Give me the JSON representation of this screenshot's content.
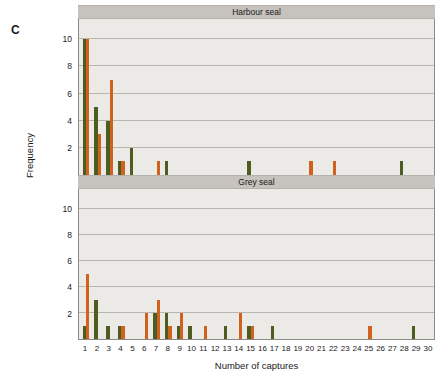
{
  "figure": {
    "panel_letter": "C",
    "x_axis_title": "Number of captures",
    "y_axis_title": "Frequency"
  },
  "panels": [
    {
      "key": "harbour",
      "title": "Harbour seal"
    },
    {
      "key": "grey",
      "title": "Grey seal"
    }
  ],
  "axis": {
    "y_ticks": [
      2,
      4,
      6,
      8,
      10
    ],
    "y_min": 0,
    "y_max": 11.5,
    "x_ticks": [
      1,
      2,
      3,
      4,
      5,
      6,
      7,
      8,
      9,
      10,
      11,
      12,
      13,
      14,
      15,
      16,
      17,
      18,
      19,
      20,
      21,
      22,
      23,
      24,
      25,
      26,
      27,
      28,
      29,
      30
    ],
    "x_min": 0.4,
    "x_max": 30.6
  },
  "colors": {
    "green": "#4d5c1f",
    "orange": "#d1611f",
    "plot_background": "#eceae7",
    "strip_background": "#c6c2bd",
    "gridline": "#b9b5b1",
    "axis_line": "#8e8a86",
    "text": "#1a1a1a"
  },
  "chart_data": {
    "type": "bar",
    "title": "",
    "xlabel": "Number of captures",
    "ylabel": "Frequency",
    "ylim": [
      0,
      11.5
    ],
    "xlim": [
      0.4,
      30.6
    ],
    "grid": true,
    "legend": "none",
    "panels": [
      {
        "name": "Harbour seal",
        "categories": [
          1,
          2,
          3,
          4,
          5,
          6,
          7,
          8,
          9,
          10,
          11,
          12,
          13,
          14,
          15,
          16,
          17,
          18,
          19,
          20,
          21,
          22,
          23,
          24,
          25,
          26,
          27,
          28,
          29,
          30
        ],
        "series": [
          {
            "name": "green",
            "color": "#4d5c1f",
            "values": [
              10,
              5,
              4,
              1,
              2,
              0,
              0,
              1,
              0,
              0,
              0,
              0,
              0,
              0,
              1,
              0,
              0,
              0,
              0,
              0,
              0,
              0,
              0,
              0,
              0,
              0,
              0,
              1,
              0,
              0
            ]
          },
          {
            "name": "orange",
            "color": "#d1611f",
            "values": [
              10,
              3,
              7,
              1,
              0,
              0,
              1,
              0,
              0,
              0,
              0,
              0,
              0,
              0,
              0,
              0,
              0,
              0,
              0,
              1,
              0,
              1,
              0,
              0,
              0,
              0,
              0,
              0,
              0,
              0
            ]
          }
        ]
      },
      {
        "name": "Grey seal",
        "categories": [
          1,
          2,
          3,
          4,
          5,
          6,
          7,
          8,
          9,
          10,
          11,
          12,
          13,
          14,
          15,
          16,
          17,
          18,
          19,
          20,
          21,
          22,
          23,
          24,
          25,
          26,
          27,
          28,
          29,
          30
        ],
        "series": [
          {
            "name": "green",
            "color": "#4d5c1f",
            "values": [
              1,
              3,
              1,
              1,
              0,
              0,
              2,
              2,
              1,
              1,
              0,
              0,
              1,
              0,
              1,
              0,
              1,
              0,
              0,
              0,
              0,
              0,
              0,
              0,
              0,
              0,
              0,
              0,
              1,
              0
            ]
          },
          {
            "name": "orange",
            "color": "#d1611f",
            "values": [
              5,
              0,
              0,
              1,
              0,
              2,
              3,
              1,
              2,
              0,
              1,
              0,
              0,
              2,
              1,
              0,
              0,
              0,
              0,
              0,
              0,
              0,
              0,
              0,
              1,
              0,
              0,
              0,
              0,
              0
            ]
          }
        ]
      }
    ]
  }
}
